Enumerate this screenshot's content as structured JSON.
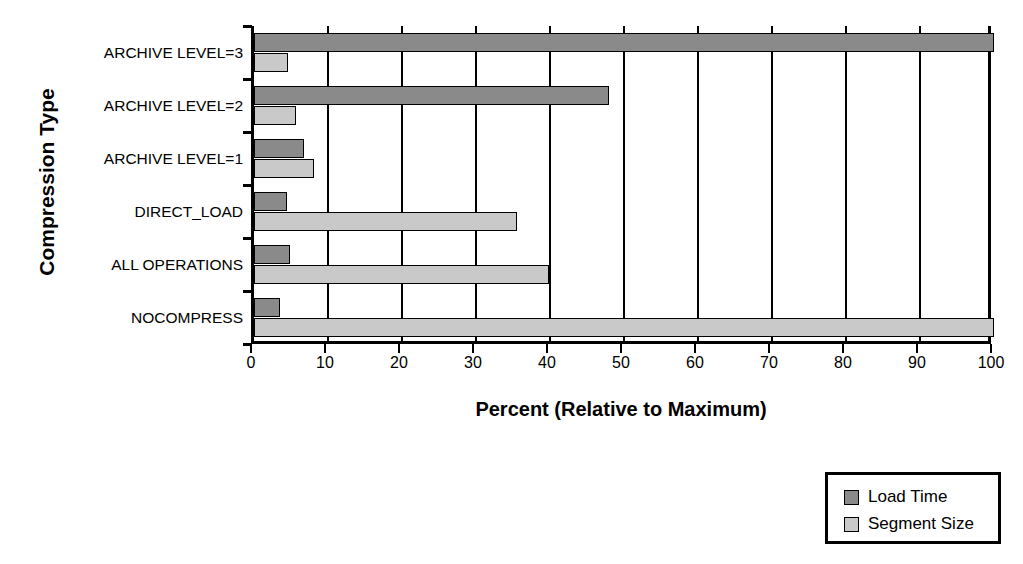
{
  "chart_data": {
    "type": "bar",
    "orientation": "horizontal",
    "title": "",
    "xlabel": "Percent (Relative to Maximum)",
    "ylabel": "Compression Type",
    "categories": [
      "ARCHIVE LEVEL=3",
      "ARCHIVE LEVEL=2",
      "ARCHIVE LEVEL=1",
      "DIRECT_LOAD",
      "ALL OPERATIONS",
      "NOCOMPRESS"
    ],
    "series": [
      {
        "name": "Load Time",
        "color": "#8a8a8a",
        "values": [
          100,
          48,
          6.8,
          4.5,
          4.9,
          3.5
        ]
      },
      {
        "name": "Segment Size",
        "color": "#c9c9c9",
        "values": [
          4.6,
          5.7,
          8.1,
          35.5,
          39.8,
          100
        ]
      }
    ],
    "xlim": [
      0,
      100
    ],
    "xticks": [
      0,
      10,
      20,
      30,
      40,
      50,
      60,
      70,
      80,
      90,
      100
    ],
    "xtick_labels": [
      "0",
      "10",
      "20",
      "30",
      "40",
      "50",
      "60",
      "70",
      "80",
      "90",
      "100"
    ],
    "grid": "vertical",
    "legend_position": "bottom-right"
  },
  "legend": {
    "items": [
      {
        "label": "Load Time",
        "swatch": "load"
      },
      {
        "label": "Segment Size",
        "swatch": "segment"
      }
    ]
  }
}
